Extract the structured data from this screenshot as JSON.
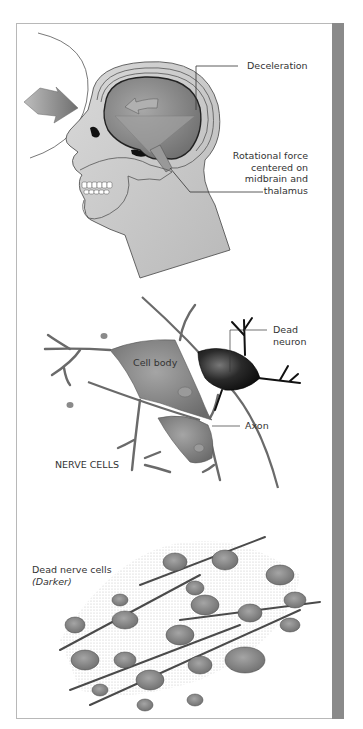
{
  "figure": {
    "panels": [
      {
        "id": "head-injury",
        "labels": {
          "deceleration": "Deceleration",
          "rotational_force": [
            "Rotational force",
            "centered on",
            "midbrain and",
            "thalamus"
          ]
        }
      },
      {
        "id": "nerve-cells",
        "labels": {
          "dead_neuron": [
            "Dead",
            "neuron"
          ],
          "cell_body": "Cell body",
          "axon": "Axon",
          "title": "NERVE CELLS"
        }
      },
      {
        "id": "dead-nerve-cells",
        "labels": {
          "title": "Dead nerve cells",
          "subtitle": "(Darker)"
        }
      }
    ],
    "colors": {
      "frame_border": "#b8b8b8",
      "side_bar": "#8a8a8a",
      "tissue_light": "#c8c8c8",
      "brain_gray": "#8f8f8f",
      "neuron_gray": "#7a7a7a",
      "dead_neuron": "#1a1a1a"
    }
  }
}
